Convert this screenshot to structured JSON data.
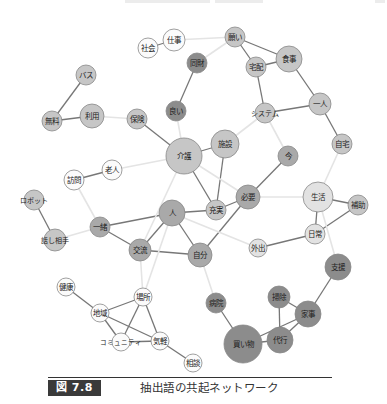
{
  "figure": {
    "number_label": "図 7.8",
    "caption": "抽出語の共起ネットワーク"
  },
  "colors": {
    "white": "#fbfbfb",
    "light": "#e2e2e2",
    "mid": "#c6c6c6",
    "gray": "#a9a9a9",
    "dark": "#8c8c8c",
    "stroke": "#888888",
    "edge_strong": "#777777",
    "edge_weak": "#e4e4e4"
  },
  "nodes": [
    {
      "id": "shigoto",
      "label": "仕事",
      "x": 174,
      "y": 40,
      "r": 11,
      "fill": "white"
    },
    {
      "id": "shakai",
      "label": "社会",
      "x": 148,
      "y": 48,
      "r": 10,
      "fill": "white"
    },
    {
      "id": "negai",
      "label": "願い",
      "x": 235,
      "y": 37,
      "r": 10,
      "fill": "mid"
    },
    {
      "id": "shokuji",
      "label": "食事",
      "x": 289,
      "y": 59,
      "r": 13,
      "fill": "mid"
    },
    {
      "id": "takuhai",
      "label": "宅配",
      "x": 256,
      "y": 67,
      "r": 10,
      "fill": "mid"
    },
    {
      "id": "dozai",
      "label": "同財",
      "x": 197,
      "y": 63,
      "r": 10,
      "fill": "dark"
    },
    {
      "id": "basu",
      "label": "バス",
      "x": 86,
      "y": 75,
      "r": 10,
      "fill": "mid"
    },
    {
      "id": "yoi",
      "label": "良い",
      "x": 176,
      "y": 111,
      "r": 10,
      "fill": "dark"
    },
    {
      "id": "muryo",
      "label": "無料",
      "x": 52,
      "y": 121,
      "r": 10,
      "fill": "mid"
    },
    {
      "id": "riyo",
      "label": "利用",
      "x": 92,
      "y": 116,
      "r": 12,
      "fill": "mid"
    },
    {
      "id": "hoken",
      "label": "保険",
      "x": 137,
      "y": 119,
      "r": 10,
      "fill": "mid"
    },
    {
      "id": "system",
      "label": "システム",
      "x": 265,
      "y": 113,
      "r": 10,
      "fill": "mid"
    },
    {
      "id": "hitori",
      "label": "一人",
      "x": 320,
      "y": 104,
      "r": 11,
      "fill": "mid"
    },
    {
      "id": "kaigo",
      "label": "介護",
      "x": 184,
      "y": 156,
      "r": 18,
      "fill": "mid"
    },
    {
      "id": "shisetsu",
      "label": "施設",
      "x": 225,
      "y": 144,
      "r": 14,
      "fill": "mid"
    },
    {
      "id": "jitaku",
      "label": "自宅",
      "x": 342,
      "y": 144,
      "r": 10,
      "fill": "mid"
    },
    {
      "id": "ima",
      "label": "今",
      "x": 288,
      "y": 156,
      "r": 10,
      "fill": "gray"
    },
    {
      "id": "rojin",
      "label": "老人",
      "x": 112,
      "y": 170,
      "r": 10,
      "fill": "white"
    },
    {
      "id": "homon",
      "label": "訪問",
      "x": 74,
      "y": 180,
      "r": 10,
      "fill": "white"
    },
    {
      "id": "robot",
      "label": "ロボット",
      "x": 34,
      "y": 200,
      "r": 10,
      "fill": "mid"
    },
    {
      "id": "hitsuyo",
      "label": "必要",
      "x": 248,
      "y": 197,
      "r": 12,
      "fill": "gray"
    },
    {
      "id": "seikatsu",
      "label": "生活",
      "x": 318,
      "y": 197,
      "r": 15,
      "fill": "light"
    },
    {
      "id": "hojo",
      "label": "補助",
      "x": 358,
      "y": 205,
      "r": 10,
      "fill": "mid"
    },
    {
      "id": "hito",
      "label": "人",
      "x": 172,
      "y": 213,
      "r": 13,
      "fill": "gray"
    },
    {
      "id": "jujitsu",
      "label": "充実",
      "x": 216,
      "y": 210,
      "r": 10,
      "fill": "mid"
    },
    {
      "id": "issho",
      "label": "一緒",
      "x": 100,
      "y": 227,
      "r": 10,
      "fill": "gray"
    },
    {
      "id": "hanashiaite",
      "label": "話し相手",
      "x": 55,
      "y": 240,
      "r": 11,
      "fill": "mid"
    },
    {
      "id": "koryu",
      "label": "交流",
      "x": 140,
      "y": 250,
      "r": 11,
      "fill": "gray"
    },
    {
      "id": "jibun",
      "label": "自分",
      "x": 200,
      "y": 255,
      "r": 12,
      "fill": "gray"
    },
    {
      "id": "gaishutsu",
      "label": "外出",
      "x": 258,
      "y": 248,
      "r": 9,
      "fill": "light"
    },
    {
      "id": "nichijo",
      "label": "日常",
      "x": 315,
      "y": 234,
      "r": 10,
      "fill": "light"
    },
    {
      "id": "shien",
      "label": "支援",
      "x": 338,
      "y": 267,
      "r": 13,
      "fill": "dark"
    },
    {
      "id": "kenko",
      "label": "健康",
      "x": 66,
      "y": 287,
      "r": 9,
      "fill": "white"
    },
    {
      "id": "basho",
      "label": "場所",
      "x": 143,
      "y": 297,
      "r": 9,
      "fill": "white"
    },
    {
      "id": "chiiki",
      "label": "地域",
      "x": 100,
      "y": 313,
      "r": 9,
      "fill": "white"
    },
    {
      "id": "byoin",
      "label": "病院",
      "x": 216,
      "y": 303,
      "r": 10,
      "fill": "dark"
    },
    {
      "id": "soji",
      "label": "掃除",
      "x": 279,
      "y": 297,
      "r": 11,
      "fill": "dark"
    },
    {
      "id": "kaji",
      "label": "家事",
      "x": 308,
      "y": 314,
      "r": 13,
      "fill": "dark"
    },
    {
      "id": "community",
      "label": "コミュニティ",
      "x": 121,
      "y": 342,
      "r": 9,
      "fill": "white"
    },
    {
      "id": "kigaru",
      "label": "気軽",
      "x": 160,
      "y": 341,
      "r": 9,
      "fill": "white"
    },
    {
      "id": "daiko",
      "label": "代行",
      "x": 280,
      "y": 340,
      "r": 13,
      "fill": "dark"
    },
    {
      "id": "kaimono",
      "label": "買い物",
      "x": 243,
      "y": 344,
      "r": 19,
      "fill": "dark"
    },
    {
      "id": "sodan",
      "label": "相談",
      "x": 193,
      "y": 363,
      "r": 9,
      "fill": "white"
    }
  ],
  "edges": [
    {
      "a": "shakai",
      "b": "shigoto",
      "w": "strong"
    },
    {
      "a": "shigoto",
      "b": "negai",
      "w": "weak"
    },
    {
      "a": "negai",
      "b": "takuhai",
      "w": "strong"
    },
    {
      "a": "negai",
      "b": "shokuji",
      "w": "strong"
    },
    {
      "a": "takuhai",
      "b": "shokuji",
      "w": "strong"
    },
    {
      "a": "takuhai",
      "b": "system",
      "w": "strong"
    },
    {
      "a": "shokuji",
      "b": "hitori",
      "w": "strong"
    },
    {
      "a": "system",
      "b": "hitori",
      "w": "strong"
    },
    {
      "a": "hitori",
      "b": "jitaku",
      "w": "strong"
    },
    {
      "a": "negai",
      "b": "dozai",
      "w": "weak"
    },
    {
      "a": "dozai",
      "b": "yoi",
      "w": "strong"
    },
    {
      "a": "basu",
      "b": "muryo",
      "w": "strong"
    },
    {
      "a": "muryo",
      "b": "riyo",
      "w": "strong"
    },
    {
      "a": "riyo",
      "b": "hoken",
      "w": "weak"
    },
    {
      "a": "hoken",
      "b": "kaigo",
      "w": "strong"
    },
    {
      "a": "yoi",
      "b": "kaigo",
      "w": "weak"
    },
    {
      "a": "kaigo",
      "b": "shisetsu",
      "w": "strong"
    },
    {
      "a": "shisetsu",
      "b": "system",
      "w": "weak"
    },
    {
      "a": "system",
      "b": "ima",
      "w": "weak"
    },
    {
      "a": "ima",
      "b": "hitsuyo",
      "w": "strong"
    },
    {
      "a": "kaigo",
      "b": "jujitsu",
      "w": "strong"
    },
    {
      "a": "shisetsu",
      "b": "jujitsu",
      "w": "strong"
    },
    {
      "a": "kaigo",
      "b": "rojin",
      "w": "weak"
    },
    {
      "a": "rojin",
      "b": "homon",
      "w": "strong"
    },
    {
      "a": "homon",
      "b": "issho",
      "w": "weak"
    },
    {
      "a": "robot",
      "b": "hanashiaite",
      "w": "strong"
    },
    {
      "a": "hanashiaite",
      "b": "issho",
      "w": "weak"
    },
    {
      "a": "issho",
      "b": "hito",
      "w": "strong"
    },
    {
      "a": "issho",
      "b": "koryu",
      "w": "strong"
    },
    {
      "a": "hito",
      "b": "koryu",
      "w": "strong"
    },
    {
      "a": "hito",
      "b": "jibun",
      "w": "strong"
    },
    {
      "a": "hito",
      "b": "jujitsu",
      "w": "strong"
    },
    {
      "a": "koryu",
      "b": "jibun",
      "w": "strong"
    },
    {
      "a": "jujitsu",
      "b": "hitsuyo",
      "w": "strong"
    },
    {
      "a": "jibun",
      "b": "hitsuyo",
      "w": "strong"
    },
    {
      "a": "hitsuyo",
      "b": "seikatsu",
      "w": "weak"
    },
    {
      "a": "kaigo",
      "b": "hitsuyo",
      "w": "weak"
    },
    {
      "a": "hito",
      "b": "gaishutsu",
      "w": "weak"
    },
    {
      "a": "jitaku",
      "b": "seikatsu",
      "w": "weak"
    },
    {
      "a": "seikatsu",
      "b": "hojo",
      "w": "strong"
    },
    {
      "a": "seikatsu",
      "b": "nichijo",
      "w": "strong"
    },
    {
      "a": "nichijo",
      "b": "hojo",
      "w": "strong"
    },
    {
      "a": "gaishutsu",
      "b": "nichijo",
      "w": "strong"
    },
    {
      "a": "seikatsu",
      "b": "shien",
      "w": "weak"
    },
    {
      "a": "shien",
      "b": "kaji",
      "w": "strong"
    },
    {
      "a": "soji",
      "b": "kaji",
      "w": "strong"
    },
    {
      "a": "soji",
      "b": "daiko",
      "w": "strong"
    },
    {
      "a": "kaji",
      "b": "daiko",
      "w": "strong"
    },
    {
      "a": "kaji",
      "b": "kaimono",
      "w": "strong"
    },
    {
      "a": "daiko",
      "b": "kaimono",
      "w": "strong"
    },
    {
      "a": "byoin",
      "b": "kaimono",
      "w": "strong"
    },
    {
      "a": "jibun",
      "b": "byoin",
      "w": "weak"
    },
    {
      "a": "hito",
      "b": "basho",
      "w": "weak"
    },
    {
      "a": "koryu",
      "b": "basho",
      "w": "weak"
    },
    {
      "a": "kaigo",
      "b": "koryu",
      "w": "weak"
    },
    {
      "a": "kenko",
      "b": "chiiki",
      "w": "strong"
    },
    {
      "a": "chiiki",
      "b": "basho",
      "w": "strong"
    },
    {
      "a": "chiiki",
      "b": "community",
      "w": "strong"
    },
    {
      "a": "chiiki",
      "b": "kigaru",
      "w": "strong"
    },
    {
      "a": "basho",
      "b": "community",
      "w": "strong"
    },
    {
      "a": "basho",
      "b": "kigaru",
      "w": "strong"
    },
    {
      "a": "community",
      "b": "kigaru",
      "w": "strong"
    },
    {
      "a": "kigaru",
      "b": "sodan",
      "w": "strong"
    }
  ]
}
